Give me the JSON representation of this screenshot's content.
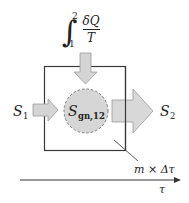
{
  "diagram": {
    "heat_term": {
      "integral_lower": "1",
      "integral_upper": "2",
      "numerator": "δQ",
      "denominator": "T"
    },
    "inflow_label": {
      "symbol": "S",
      "subscript": "1"
    },
    "outflow_label": {
      "symbol": "S",
      "subscript": "2"
    },
    "generation_label": {
      "symbol": "S",
      "subscript": "gn,12"
    },
    "system_label": "m × Δτ",
    "time_axis_label": "τ",
    "colors": {
      "arrow_fill": "#d4d4d4",
      "arrow_stroke": "#9a9a9a",
      "circle_fill": "#d6d6d6",
      "circle_stroke": "#7a7a7a",
      "box_stroke": "#3a3a3a",
      "text": "#222222"
    }
  }
}
